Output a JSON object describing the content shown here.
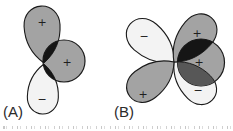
{
  "figure": {
    "background": "#ffffff",
    "colors": {
      "shaded_lobe": "#a3a3a3",
      "unshaded_lobe": "#f3f3f3",
      "overlap_dark": "#151515",
      "overlap_medium": "#575757",
      "outline": "#1a1a1a"
    },
    "panels": [
      {
        "id": "A",
        "label": "(A)",
        "lobes": [
          {
            "name": "p-lobe-top",
            "sign": "+",
            "shaded": true
          },
          {
            "name": "s-orbital-circle",
            "sign": "+",
            "shaded": true
          },
          {
            "name": "p-lobe-bottom",
            "sign": "−",
            "shaded": false
          }
        ]
      },
      {
        "id": "B",
        "label": "(B)",
        "lobes": [
          {
            "name": "d-lobe-top-left",
            "sign": "−",
            "shaded": false
          },
          {
            "name": "d-lobe-top-right",
            "sign": "+",
            "shaded": true
          },
          {
            "name": "d-lobe-bottom-left",
            "sign": "+",
            "shaded": true
          },
          {
            "name": "d-lobe-bottom-right",
            "sign": "−",
            "shaded": false
          },
          {
            "name": "s-orbital-circle",
            "sign": "+",
            "shaded": true
          }
        ]
      }
    ]
  }
}
